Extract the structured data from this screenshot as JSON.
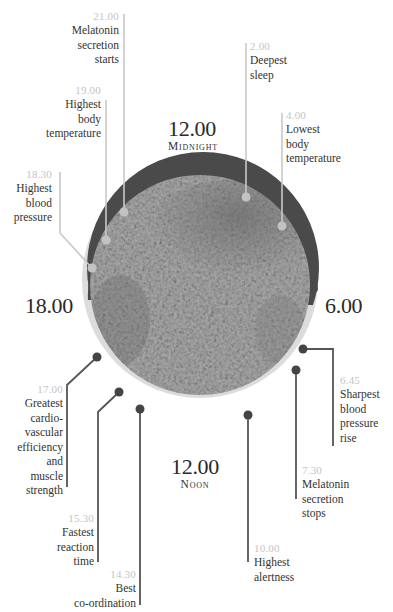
{
  "hours": {
    "midnight": {
      "time": "12.00",
      "caption": "Midnight"
    },
    "noon": {
      "time": "12.00",
      "caption": "Noon"
    },
    "evening": {
      "time": "18.00"
    },
    "morning": {
      "time": "6.00"
    }
  },
  "events": [
    {
      "time": "21.00",
      "label": "Melatonin secretion starts",
      "lines": [
        "Melatonin",
        "secretion",
        "starts"
      ]
    },
    {
      "time": "19.00",
      "label": "Highest body temperature",
      "lines": [
        "Highest",
        "body",
        "temperature"
      ]
    },
    {
      "time": "18.30",
      "label": "Highest blood pressure",
      "lines": [
        "Highest",
        "blood",
        "pressure"
      ]
    },
    {
      "time": "17.00",
      "label": "Greatest cardio-vascular efficiency and muscle strength",
      "lines": [
        "Greatest",
        "cardio-",
        "vascular",
        "efficiency",
        "and",
        "muscle",
        "strength"
      ]
    },
    {
      "time": "15.30",
      "label": "Fastest reaction time",
      "lines": [
        "Fastest",
        "reaction",
        "time"
      ]
    },
    {
      "time": "14.30",
      "label": "Best co-ordination",
      "lines": [
        "Best",
        "co-ordination"
      ]
    },
    {
      "time": "10.00",
      "label": "Highest alertness",
      "lines": [
        "Highest",
        "alertness"
      ]
    },
    {
      "time": "7.30",
      "label": "Melatonin secretion stops",
      "lines": [
        "Melatonin",
        "secretion",
        "stops"
      ]
    },
    {
      "time": "6.45",
      "label": "Sharpest blood pressure rise",
      "lines": [
        "Sharpest",
        "blood",
        "pressure",
        "rise"
      ]
    },
    {
      "time": "2.00",
      "label": "Deepest sleep",
      "lines": [
        "Deepest",
        "sleep"
      ]
    },
    {
      "time": "4.00",
      "label": "Lowest body temperature",
      "lines": [
        "Lowest",
        "body",
        "temperature"
      ]
    }
  ],
  "colors": {
    "night_arc": "#4a4a4a",
    "day_arc": "#d9d9d9",
    "night_line": "#c8c8c8",
    "day_line": "#555555",
    "time_text": "#c4c4c4"
  }
}
